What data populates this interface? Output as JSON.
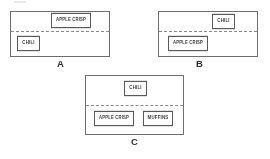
{
  "figure": {
    "type": "diagram",
    "panels": [
      {
        "caption": "A",
        "caption_x": 57,
        "caption_y": 59,
        "frame": {
          "x": 10,
          "y": 11,
          "w": 100,
          "h": 46
        },
        "divider_y": 19,
        "items": [
          {
            "label": "APPLE CRISP",
            "x": 40,
            "y": 2,
            "w": 40,
            "h": 13,
            "region": "above",
            "size": "wide"
          },
          {
            "label": "CHILI",
            "x": 6,
            "y": 25,
            "w": 23,
            "h": 13,
            "region": "below",
            "size": "normal"
          }
        ]
      },
      {
        "caption": "B",
        "caption_x": 196,
        "caption_y": 59,
        "frame": {
          "x": 158,
          "y": 11,
          "w": 100,
          "h": 46
        },
        "divider_y": 19,
        "items": [
          {
            "label": "CHILI",
            "x": 53,
            "y": 3,
            "w": 23,
            "h": 13,
            "region": "above",
            "size": "normal"
          },
          {
            "label": "APPLE CRISP",
            "x": 9,
            "y": 25,
            "w": 40,
            "h": 13,
            "region": "below",
            "size": "wide"
          }
        ]
      },
      {
        "caption": "C",
        "caption_x": 131,
        "caption_y": 137,
        "frame": {
          "x": 85,
          "y": 75,
          "w": 99,
          "h": 60
        },
        "divider_y": 29,
        "items": [
          {
            "label": "CHILI",
            "x": 38,
            "y": 6,
            "w": 23,
            "h": 13,
            "region": "above",
            "size": "normal"
          },
          {
            "label": "APPLE CRISP",
            "x": 8,
            "y": 36,
            "w": 40,
            "h": 13,
            "region": "below",
            "size": "wide"
          },
          {
            "label": "MUFFINS",
            "x": 57,
            "y": 36,
            "w": 30,
            "h": 13,
            "region": "below",
            "size": "normal"
          }
        ]
      }
    ],
    "colors": {
      "frame_stroke": "#6e6e6e",
      "divider_stroke": "#8a8a8a",
      "item_stroke": "#595959",
      "item_text": "#3a3a3a",
      "caption_text": "#2e2e2e",
      "background": "#ffffff"
    }
  }
}
